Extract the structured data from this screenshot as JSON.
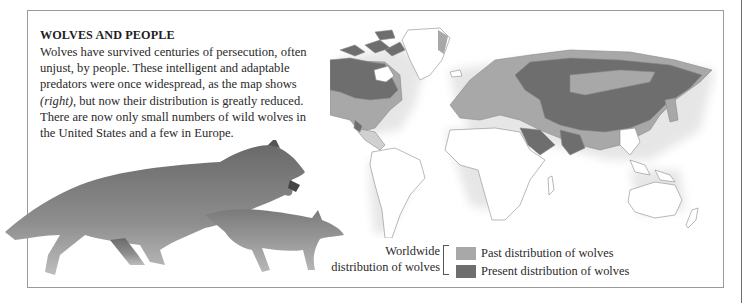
{
  "panel": {
    "title": "WOLVES AND PEOPLE",
    "body_before_italic": "Wolves have survived centuries of persecution, often unjust, by people. These intelligent and adaptable predators were once widespread, as the map shows ",
    "body_italic": "(right)",
    "body_after_italic": ", but now their distribution is greatly reduced. There are now only small numbers of wild wolves in the United States and a few in Europe."
  },
  "map": {
    "name": "world-map",
    "colors": {
      "land": "#ffffff",
      "outline": "#8a8a8a",
      "past": "#a8a8a8",
      "present": "#6e6e6e",
      "halo": "#e4e4e4"
    }
  },
  "illustration": {
    "subject": "running adult wolf and cub"
  },
  "legend": {
    "label_line1": "Worldwide",
    "label_line2": "distribution of wolves",
    "items": [
      {
        "label": "Past distribution of wolves",
        "color": "#a8a8a8"
      },
      {
        "label": "Present distribution of wolves",
        "color": "#6e6e6e"
      }
    ]
  }
}
